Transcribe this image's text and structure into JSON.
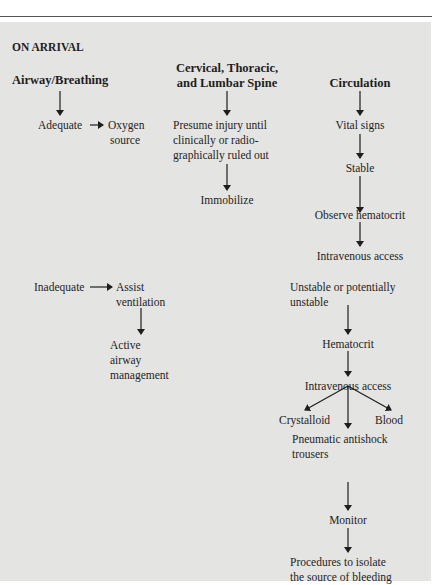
{
  "section_title": "ON ARRIVAL",
  "columns": {
    "airway": {
      "header": "Airway/Breathing",
      "adequate": "Adequate",
      "oxygen": [
        "Oxygen",
        "source"
      ],
      "inadequate": "Inadequate",
      "assist": [
        "Assist",
        "ventilation"
      ],
      "active": [
        "Active",
        "airway",
        "management"
      ]
    },
    "spine": {
      "header": [
        "Cervical, Thoracic,",
        "and Lumbar Spine"
      ],
      "presume": [
        "Presume injury until",
        "clinically or radio-",
        "graphically ruled out"
      ],
      "immobilize": "Immobilize"
    },
    "circulation": {
      "header": "Circulation",
      "vital_signs": "Vital signs",
      "stable": "Stable",
      "observe": "Observe hematocrit",
      "iv_access_1": "Intravenous access",
      "unstable": [
        "Unstable or potentially",
        "unstable"
      ],
      "hematocrit": "Hematocrit",
      "iv_access_2": "Intravenous access",
      "crystalloid": "Crystalloid",
      "blood": "Blood",
      "pneumatic": [
        "Pneumatic antishock",
        "trousers"
      ],
      "monitor": "Monitor",
      "procedures": [
        "Procedures to isolate",
        "the source of bleeding"
      ]
    }
  },
  "colors": {
    "panel": "#e4e4e2",
    "text": "#1e1e1e",
    "rule": "#555555"
  }
}
